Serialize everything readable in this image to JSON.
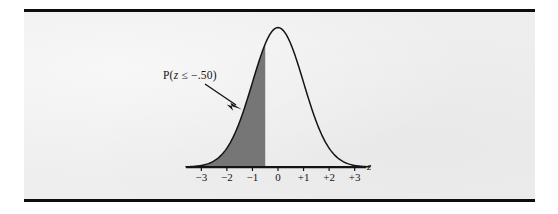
{
  "figure": {
    "annotation": {
      "prefix": "P(",
      "variable": "z",
      "relation": " ≤ −.50",
      "suffix": ")",
      "full_text": "P(z ≤ −.50)"
    },
    "axis_label": "z",
    "tick_labels": [
      "−3",
      "−2",
      "−1",
      "0",
      "+1",
      "+2",
      "+3"
    ],
    "colors": {
      "page_background": "#eeeeee",
      "rule": "#0d0d0d",
      "curve": "#141414",
      "shaded_region": "#767676",
      "axis": "#141414",
      "text": "#141414"
    }
  },
  "chart_data": {
    "type": "area",
    "title": "",
    "subtitle": "",
    "xlabel": "z",
    "ylabel": "",
    "xlim": [
      -3.6,
      3.6
    ],
    "ylim": [
      0,
      0.42
    ],
    "grid": false,
    "legend": null,
    "curve": {
      "name": "Standard normal density",
      "distribution": "normal",
      "mean": 0,
      "sd": 1,
      "x": [
        -3.6,
        -3.4,
        -3.2,
        -3.0,
        -2.8,
        -2.6,
        -2.4,
        -2.2,
        -2.0,
        -1.8,
        -1.6,
        -1.4,
        -1.2,
        -1.0,
        -0.8,
        -0.6,
        -0.5,
        -0.4,
        -0.2,
        0.0,
        0.2,
        0.4,
        0.6,
        0.8,
        1.0,
        1.2,
        1.4,
        1.6,
        1.8,
        2.0,
        2.2,
        2.4,
        2.6,
        2.8,
        3.0,
        3.2,
        3.4,
        3.6
      ],
      "y": [
        0.0006,
        0.0012,
        0.0024,
        0.0044,
        0.0079,
        0.0136,
        0.0224,
        0.0355,
        0.054,
        0.079,
        0.1109,
        0.1497,
        0.1942,
        0.242,
        0.2897,
        0.3332,
        0.3521,
        0.3683,
        0.391,
        0.3989,
        0.391,
        0.3683,
        0.3332,
        0.2897,
        0.242,
        0.1942,
        0.1497,
        0.1109,
        0.079,
        0.054,
        0.0355,
        0.0224,
        0.0136,
        0.0079,
        0.0044,
        0.0024,
        0.0012,
        0.0006
      ]
    },
    "shaded": {
      "label": "P(z ≤ −.50)",
      "from": -3.6,
      "to": -0.5,
      "boundary_z": -0.5,
      "area": 0.3085,
      "fill": "#767676"
    },
    "annotations": [
      {
        "text": "P(z ≤ −.50)",
        "type": "arrow-callout",
        "points_to_z": -0.9
      }
    ],
    "ticks": {
      "x": [
        -3,
        -2,
        -1,
        0,
        1,
        2,
        3
      ],
      "x_labels": [
        "−3",
        "−2",
        "−1",
        "0",
        "+1",
        "+2",
        "+3"
      ],
      "y": []
    }
  }
}
